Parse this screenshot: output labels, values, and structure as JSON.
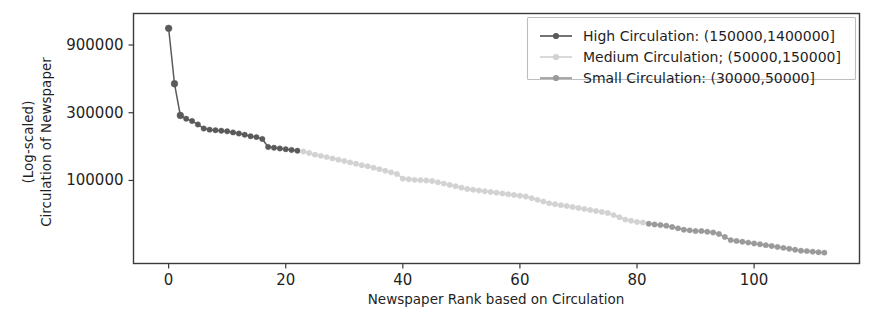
{
  "chart_data": {
    "type": "line",
    "title": "",
    "subtitle": "",
    "xlabel": "Newspaper Rank based on Circulation",
    "ylabel_line1": "(Log-scaled)",
    "ylabel_line2": "Circulation of Newspaper",
    "yscale": "log",
    "xscale": "linear",
    "grid": false,
    "legend_position": "upper right",
    "xlim": [
      -6,
      118
    ],
    "ylim": [
      26000,
      1500000
    ],
    "xticks": [
      0,
      20,
      40,
      60,
      80,
      100
    ],
    "xtick_labels": [
      "0",
      "20",
      "40",
      "60",
      "80",
      "100"
    ],
    "yticks": [
      100000,
      300000,
      900000
    ],
    "ytick_labels": [
      "100000",
      "300000",
      "900000"
    ],
    "marker": "circle",
    "series": [
      {
        "name": "High Circulation: (150000,1400000]",
        "color": "#5a5a5a",
        "x": [
          0,
          1,
          2,
          3,
          4,
          5,
          6,
          7,
          8,
          9,
          10,
          11,
          12,
          13,
          14,
          15,
          16,
          17,
          18,
          19,
          20,
          21,
          22
        ],
        "y": [
          1180000,
          480000,
          287000,
          272000,
          262000,
          248000,
          232000,
          228000,
          226000,
          224000,
          222000,
          218000,
          214000,
          210000,
          205000,
          202000,
          196000,
          172000,
          170000,
          168000,
          166000,
          164000,
          162000
        ]
      },
      {
        "name": "Medium Circulation; (50000,150000]",
        "color": "#d2d2d2",
        "x": [
          23,
          24,
          25,
          26,
          27,
          28,
          29,
          30,
          31,
          32,
          33,
          34,
          35,
          36,
          37,
          38,
          39,
          40,
          41,
          42,
          43,
          44,
          45,
          46,
          47,
          48,
          49,
          50,
          51,
          52,
          53,
          54,
          55,
          56,
          57,
          58,
          59,
          60,
          61,
          62,
          63,
          64,
          65,
          66,
          67,
          68,
          69,
          70,
          71,
          72,
          73,
          74,
          75,
          76,
          77,
          78,
          79,
          80,
          81
        ],
        "y": [
          160000,
          156000,
          152000,
          149000,
          146000,
          143000,
          140000,
          137000,
          134000,
          131000,
          128000,
          126000,
          123000,
          120000,
          117000,
          114000,
          111000,
          103000,
          102000,
          101000,
          100500,
          100000,
          99000,
          97000,
          95000,
          93000,
          91000,
          89000,
          87000,
          86000,
          85000,
          84000,
          83000,
          82000,
          81000,
          80000,
          79000,
          78000,
          77000,
          75000,
          73000,
          71000,
          69000,
          68000,
          67000,
          66000,
          65000,
          64000,
          63000,
          62000,
          61000,
          60000,
          59000,
          57000,
          55000,
          53000,
          52000,
          51000,
          50500
        ]
      },
      {
        "name": "Small Circulation: (30000,50000]",
        "color": "#9a9a9a",
        "x": [
          82,
          83,
          84,
          85,
          86,
          87,
          88,
          89,
          90,
          91,
          92,
          93,
          94,
          95,
          96,
          97,
          98,
          99,
          100,
          101,
          102,
          103,
          104,
          105,
          106,
          107,
          108,
          109,
          110,
          111,
          112
        ],
        "y": [
          49500,
          49000,
          48500,
          48000,
          47000,
          46000,
          45000,
          44500,
          44000,
          44000,
          43500,
          43000,
          42000,
          40000,
          38000,
          37500,
          37000,
          36500,
          36000,
          35500,
          35000,
          34500,
          34000,
          33500,
          33000,
          32500,
          32000,
          31800,
          31500,
          31200,
          31000
        ]
      }
    ]
  },
  "legend": {
    "entries": [
      {
        "label": "High Circulation: (150000,1400000]",
        "color": "#5a5a5a"
      },
      {
        "label": "Medium Circulation; (50000,150000]",
        "color": "#d2d2d2"
      },
      {
        "label": "Small Circulation: (30000,50000]",
        "color": "#9a9a9a"
      }
    ]
  },
  "colors": {
    "background": "#ffffff",
    "axis": "#3a3a3a",
    "text": "#1f1f1f",
    "legend_border": "#bdbdbd"
  }
}
